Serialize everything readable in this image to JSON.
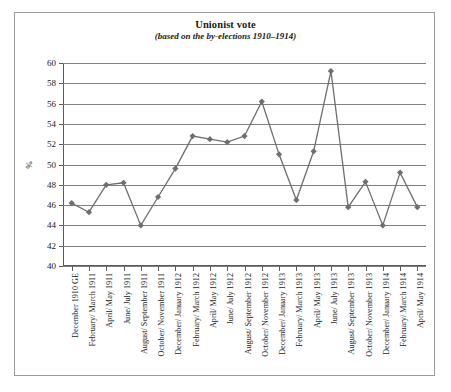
{
  "chart_data": {
    "type": "line",
    "title": "Unionist vote",
    "subtitle": "(based on the by-elections 1910–1914)",
    "xlabel": "",
    "ylabel": "%",
    "ylim": [
      40,
      60
    ],
    "ytick_step": 2,
    "yticks": [
      40,
      42,
      44,
      46,
      48,
      50,
      52,
      54,
      56,
      58,
      60
    ],
    "grid": true,
    "legend": "none",
    "marker": "diamond",
    "series_color": "#6e6e6e",
    "grid_color": "#808080",
    "categories": [
      "December 1910 GE",
      "February/ March 1911",
      "April/ May 1911",
      "June/ July 1911",
      "August/ September 1911",
      "October/ November 1911",
      "December/ January 1912",
      "February/ March 1912",
      "April/ May 1912",
      "June/ July 1912",
      "August/ September 1912",
      "October/ November 1912",
      "December/ January 1913",
      "February/ March 1913",
      "April/ May 1913",
      "June/ July 1913",
      "August/ September 1913",
      "October/ November 1913",
      "December/ January 1914",
      "February/ March 1914",
      "April/ May 1914"
    ],
    "values": [
      46.2,
      45.3,
      48.0,
      48.2,
      44.0,
      46.8,
      49.6,
      52.8,
      52.5,
      52.2,
      52.8,
      56.2,
      51.0,
      46.5,
      51.3,
      59.2,
      45.8,
      48.3,
      44.0,
      49.2,
      45.8
    ]
  }
}
